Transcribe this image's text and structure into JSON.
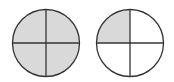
{
  "diagram": {
    "colors": {
      "fill": "#d9d9d9",
      "stroke": "#333333",
      "background": "#ffffff"
    },
    "circles": [
      {
        "name": "whole",
        "cx": 46,
        "cy": 43,
        "r": 34,
        "parts": 4,
        "shaded_parts": 4,
        "fraction": "4/4"
      },
      {
        "name": "quarter",
        "cx": 130,
        "cy": 43,
        "r": 34,
        "parts": 4,
        "shaded_parts": 1,
        "fraction": "1/4"
      }
    ]
  }
}
